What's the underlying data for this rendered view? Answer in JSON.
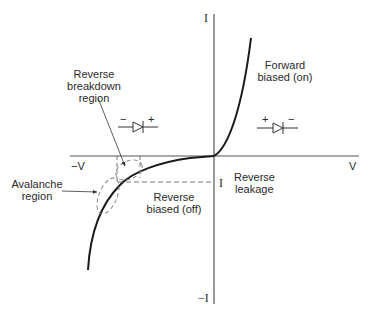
{
  "diagram": {
    "type": "diode I-V characteristic",
    "axes": {
      "y_positive_label": "I",
      "y_negative_label": "−I",
      "x_positive_label": "V",
      "x_negative_label": "−V"
    },
    "regions": {
      "forward": {
        "line1": "Forward",
        "line2": "biased (on)"
      },
      "reverse_biased": {
        "line1": "Reverse",
        "line2": "biased (off)"
      },
      "reverse_leakage": {
        "line1": "Reverse",
        "line2": "leakage",
        "current_label": "I"
      },
      "breakdown": {
        "line1": "Reverse",
        "line2": "breakdown",
        "line3": "region"
      },
      "avalanche": {
        "line1": "Avalanche",
        "line2": "region"
      }
    },
    "symbols": {
      "reverse_diode": {
        "left": "−",
        "right": "+"
      },
      "forward_diode": {
        "left": "+",
        "right": "−"
      }
    },
    "colors": {
      "curve": "#1a1a1a",
      "axis": "#555555",
      "dashed": "#666666",
      "text": "#2a2a2a",
      "background": "#ffffff"
    }
  }
}
